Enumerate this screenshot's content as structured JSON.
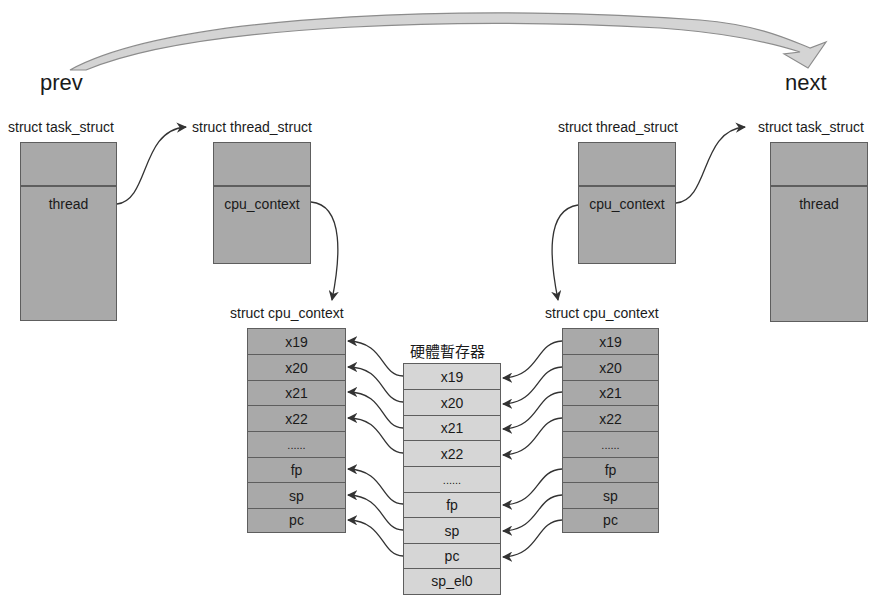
{
  "diagram": {
    "top_arrow": {
      "from_label": "prev",
      "to_label": "next"
    },
    "left": {
      "task_struct": {
        "title": "struct task_struct",
        "field": "thread"
      },
      "thread_struct": {
        "title": "struct thread_struct",
        "field": "cpu_context"
      },
      "cpu_context": {
        "title": "struct cpu_context",
        "registers": [
          "x19",
          "x20",
          "x21",
          "x22",
          "......",
          "fp",
          "sp",
          "pc"
        ]
      }
    },
    "right": {
      "thread_struct": {
        "title": "struct thread_struct",
        "field": "cpu_context"
      },
      "task_struct": {
        "title": "struct task_struct",
        "field": "thread"
      },
      "cpu_context": {
        "title": "struct cpu_context",
        "registers": [
          "x19",
          "x20",
          "x21",
          "x22",
          "......",
          "fp",
          "sp",
          "pc"
        ]
      }
    },
    "hardware": {
      "title": "硬體暫存器",
      "registers": [
        "x19",
        "x20",
        "x21",
        "x22",
        "......",
        "fp",
        "sp",
        "pc",
        "sp_el0"
      ]
    },
    "colors": {
      "struct_fill": "#a9a9a9",
      "hw_fill": "#d6d6d6",
      "border": "#5e5e5e",
      "arrow": "#333333"
    }
  }
}
